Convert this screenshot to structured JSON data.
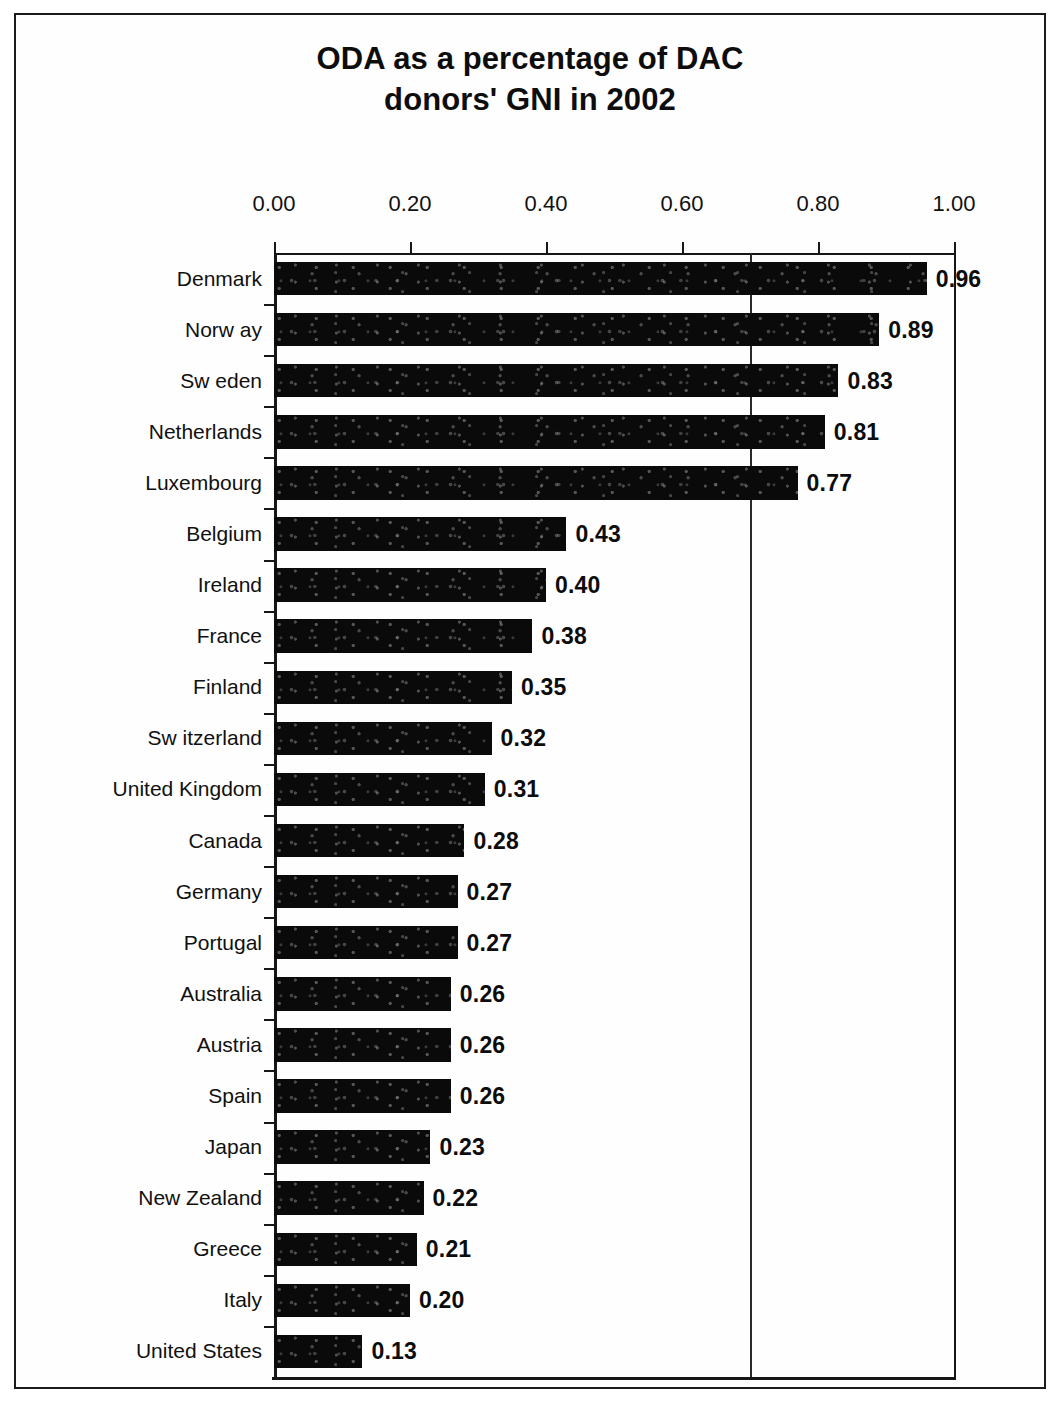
{
  "chart_data": {
    "type": "bar",
    "orientation": "horizontal",
    "title": "ODA as a percentage of DAC donors' GNI in 2002",
    "title_lines": [
      "ODA as a percentage of DAC",
      "donors' GNI in 2002"
    ],
    "xlabel": "",
    "ylabel": "",
    "xlim": [
      0.0,
      1.0
    ],
    "xticks": [
      0.0,
      0.2,
      0.4,
      0.6,
      0.8,
      1.0
    ],
    "xtick_labels": [
      "0.00",
      "0.20",
      "0.40",
      "0.60",
      "0.80",
      "1.00"
    ],
    "gridlines_x": [
      0.7
    ],
    "grid": "single vertical gridline at 0.70",
    "legend": null,
    "legend_position": "none",
    "bar_color": "#0a0a0a",
    "data_labels": true,
    "categories": [
      "Denmark",
      "Norw ay",
      "Sw eden",
      "Netherlands",
      "Luxembourg",
      "Belgium",
      "Ireland",
      "France",
      "Finland",
      "Sw itzerland",
      "United Kingdom",
      "Canada",
      "Germany",
      "Portugal",
      "Australia",
      "Austria",
      "Spain",
      "Japan",
      "New  Zealand",
      "Greece",
      "Italy",
      "United States"
    ],
    "values": [
      0.96,
      0.89,
      0.83,
      0.81,
      0.77,
      0.43,
      0.4,
      0.38,
      0.35,
      0.32,
      0.31,
      0.28,
      0.27,
      0.27,
      0.26,
      0.26,
      0.26,
      0.23,
      0.22,
      0.21,
      0.2,
      0.13
    ],
    "value_labels": [
      "0.96",
      "0.89",
      "0.83",
      "0.81",
      "0.77",
      "0.43",
      "0.40",
      "0.38",
      "0.35",
      "0.32",
      "0.31",
      "0.28",
      "0.27",
      "0.27",
      "0.26",
      "0.26",
      "0.26",
      "0.23",
      "0.22",
      "0.21",
      "0.20",
      "0.13"
    ]
  }
}
